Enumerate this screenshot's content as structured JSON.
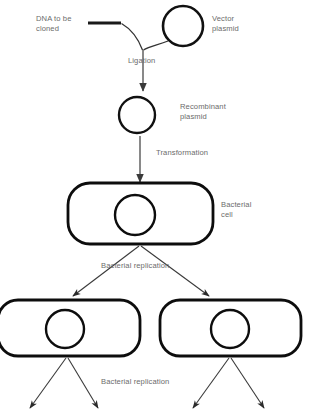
{
  "diagram": {
    "type": "flow-diagram",
    "canvas": {
      "width": 311,
      "height": 417,
      "background": "#ffffff"
    },
    "colors": {
      "stroke": "#000000",
      "label_text": "#6b6b6b",
      "arrow": "#3a3a3a",
      "background": "#ffffff"
    },
    "labels": {
      "dna_to_be_cloned": "DNA to be\ncloned",
      "vector_plasmid": "Vector\nplasmid",
      "ligation": "Ligation",
      "recombinant_plasmid": "Recombinant\nplasmid",
      "transformation": "Transformation",
      "bacterial_cell": "Bacterial\ncell",
      "bacterial_replication_1": "Bacterial replication",
      "bacterial_replication_2": "Bacterial replication"
    },
    "shapes": {
      "vector_plasmid_circle": {
        "cx": 183,
        "cy": 26,
        "r": 20
      },
      "dna_segment": {
        "x1": 88,
        "y1": 23,
        "x2": 121,
        "y2": 23
      },
      "recombinant_plasmid_circle": {
        "cx": 137,
        "cy": 115,
        "r": 18
      },
      "bacterial_cell": {
        "x": 68,
        "y": 183,
        "width": 145,
        "height": 61,
        "rx": 22
      },
      "bacterial_cell_nucleus": {
        "cx": 135,
        "cy": 215,
        "r": 20
      },
      "daughter_cell_left": {
        "x": -2,
        "y": 300,
        "width": 142,
        "height": 56,
        "rx": 20
      },
      "daughter_cell_left_nucleus": {
        "cx": 65,
        "cy": 329,
        "r": 19
      },
      "daughter_cell_right": {
        "x": 160,
        "y": 300,
        "width": 141,
        "height": 56,
        "rx": 20
      },
      "daughter_cell_right_nucleus": {
        "cx": 230,
        "cy": 329,
        "r": 19
      }
    },
    "steps": [
      {
        "order": 1,
        "name": "dna-to-be-cloned",
        "label": "DNA to be cloned"
      },
      {
        "order": 2,
        "name": "vector-plasmid",
        "label": "Vector plasmid"
      },
      {
        "order": 3,
        "name": "ligation",
        "label": "Ligation"
      },
      {
        "order": 4,
        "name": "recombinant-plasmid",
        "label": "Recombinant plasmid"
      },
      {
        "order": 5,
        "name": "transformation",
        "label": "Transformation"
      },
      {
        "order": 6,
        "name": "bacterial-cell",
        "label": "Bacterial cell"
      },
      {
        "order": 7,
        "name": "bacterial-replication-1",
        "label": "Bacterial replication"
      },
      {
        "order": 8,
        "name": "bacterial-replication-2",
        "label": "Bacterial replication"
      }
    ]
  }
}
